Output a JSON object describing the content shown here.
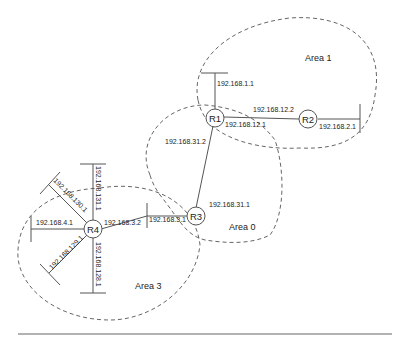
{
  "areas": [
    {
      "id": "area0",
      "label": "Area 0"
    },
    {
      "id": "area1",
      "label": "Area 1"
    },
    {
      "id": "area3",
      "label": "Area 3"
    }
  ],
  "routers": [
    {
      "id": "R1",
      "label": "R1"
    },
    {
      "id": "R2",
      "label": "R2"
    },
    {
      "id": "R3",
      "label": "R3"
    },
    {
      "id": "R4",
      "label": "R4"
    }
  ],
  "interfaces": {
    "r1_lan": "192.168.1.1",
    "r1_r2": "192.168.12.1",
    "r2_r1": "192.168.12.2",
    "r2_lan": "192.168.2.1",
    "r1_r3": "192.168.31.2",
    "r3_r1": "192.168.31.1",
    "r3_r4": "192.168.3.1",
    "r4_r3": "192.168.3.2",
    "r4_lan4": "192.168.4.1",
    "r4_lan130": "192.168.130.1",
    "r4_lan131": "192.168.131.1",
    "r4_lan129": "192.168.129.1",
    "r4_lan128": "192.168.128.1"
  }
}
